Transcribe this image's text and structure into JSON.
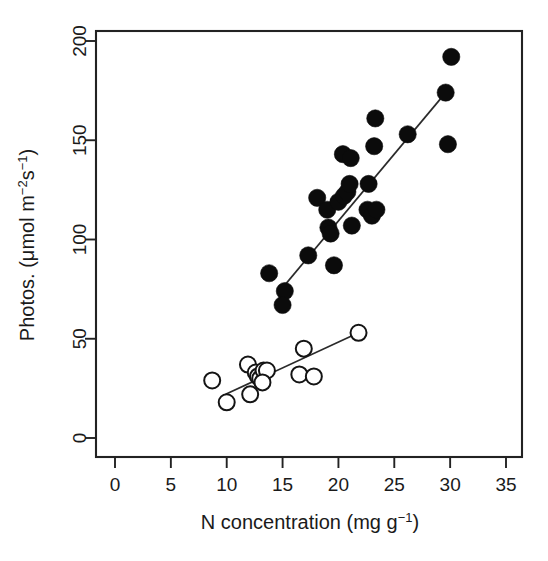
{
  "chart_data": {
    "type": "scatter",
    "title": "",
    "xlabel": "N concentration (mg g⁻¹)",
    "ylabel": "Photos. (μmol m⁻²s⁻¹)",
    "xlabel_parts": {
      "main": "N concentration (mg g",
      "sup": "−1",
      "tail": ")"
    },
    "ylabel_parts": {
      "main": "Photos. (μmol m",
      "sup1": "−2",
      "mid": "s",
      "sup2": "−1",
      "tail": ")"
    },
    "xlim": [
      0,
      35
    ],
    "ylim": [
      0,
      205
    ],
    "xticks": [
      0,
      5,
      10,
      15,
      20,
      25,
      30,
      35
    ],
    "yticks": [
      0,
      50,
      100,
      150,
      200
    ],
    "xtick_labels": [
      "0",
      "5",
      "10",
      "15",
      "20",
      "25",
      "30",
      "35"
    ],
    "ytick_labels": [
      "0",
      "50",
      "100",
      "150",
      "200"
    ],
    "grid": false,
    "legend": "none",
    "box": true,
    "series": [
      {
        "name": "filled-circles",
        "marker": "filled-circle",
        "color": "#0b0b0b",
        "points": [
          [
            13.8,
            83
          ],
          [
            15.2,
            74
          ],
          [
            15.0,
            67
          ],
          [
            17.3,
            92
          ],
          [
            18.1,
            121
          ],
          [
            19.0,
            115
          ],
          [
            19.1,
            106
          ],
          [
            19.3,
            103
          ],
          [
            19.6,
            87
          ],
          [
            20.0,
            119
          ],
          [
            20.5,
            122
          ],
          [
            20.8,
            124
          ],
          [
            21.0,
            128
          ],
          [
            20.4,
            143
          ],
          [
            21.1,
            141
          ],
          [
            21.2,
            107
          ],
          [
            22.6,
            115
          ],
          [
            23.0,
            112
          ],
          [
            23.4,
            115
          ],
          [
            22.7,
            128
          ],
          [
            23.2,
            147
          ],
          [
            23.3,
            161
          ],
          [
            26.2,
            153
          ],
          [
            29.6,
            174
          ],
          [
            29.8,
            148
          ],
          [
            30.1,
            192
          ]
        ]
      },
      {
        "name": "open-circles",
        "marker": "open-circle",
        "color": "#ffffff",
        "points": [
          [
            8.7,
            29
          ],
          [
            10.0,
            18
          ],
          [
            11.9,
            37
          ],
          [
            12.1,
            22
          ],
          [
            12.6,
            33
          ],
          [
            12.8,
            31
          ],
          [
            13.0,
            30
          ],
          [
            13.3,
            34
          ],
          [
            13.6,
            34
          ],
          [
            13.2,
            28
          ],
          [
            16.5,
            32
          ],
          [
            17.8,
            31
          ],
          [
            16.9,
            45
          ],
          [
            21.8,
            53
          ]
        ]
      }
    ],
    "fit_lines": [
      {
        "name": "filled-fit",
        "x0": 14.6,
        "y0": 73,
        "x1": 29.6,
        "y1": 174
      },
      {
        "name": "open-fit",
        "x0": 9.9,
        "y0": 22,
        "x1": 21.8,
        "y1": 53
      }
    ]
  }
}
